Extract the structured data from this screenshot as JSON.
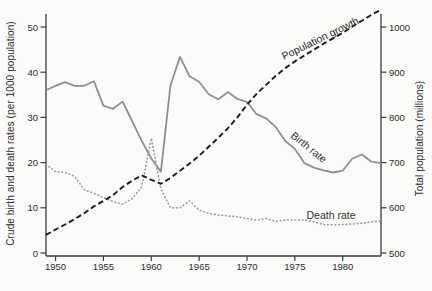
{
  "figure": {
    "background": "#fbfbf9",
    "axis_color": "#3a3a3a",
    "tick_label_color": "#2b2b2b",
    "left_axis_title": "Crude birth and death rates (per 1000 population)",
    "right_axis_title": "Total population (millions)",
    "curve_labels": {
      "population": "Population growth",
      "birth": "Birth rate",
      "death": "Death rate"
    }
  },
  "chart_data": {
    "type": "line",
    "title": "",
    "xlabel": "",
    "ylabel_left": "Crude birth and death rates (per 1000 population)",
    "ylabel_right": "Total population (millions)",
    "grid": false,
    "legend_position": "labels-on-curves",
    "x_axis": {
      "range": [
        1949,
        1984
      ],
      "ticks": [
        1950,
        1955,
        1960,
        1965,
        1970,
        1975,
        1980
      ]
    },
    "left_axis": {
      "range": [
        0,
        53
      ],
      "ticks": [
        0,
        10,
        20,
        30,
        40,
        50
      ]
    },
    "right_axis": {
      "range": [
        500,
        1040
      ],
      "ticks": [
        500,
        600,
        700,
        800,
        900,
        1000
      ]
    },
    "x": [
      1949,
      1950,
      1951,
      1952,
      1953,
      1954,
      1955,
      1956,
      1957,
      1958,
      1959,
      1960,
      1961,
      1962,
      1963,
      1964,
      1965,
      1966,
      1967,
      1968,
      1969,
      1970,
      1971,
      1972,
      1973,
      1974,
      1975,
      1976,
      1977,
      1978,
      1979,
      1980,
      1981,
      1982,
      1983,
      1984
    ],
    "series": [
      {
        "name": "Birth rate",
        "axis": "left",
        "style": "solid",
        "color": "#8f8f8f",
        "values": [
          36.0,
          37.0,
          37.8,
          37.0,
          37.0,
          38.0,
          32.6,
          31.9,
          33.5,
          29.2,
          24.8,
          20.9,
          18.0,
          37.0,
          43.4,
          39.1,
          37.9,
          35.1,
          34.0,
          35.6,
          34.1,
          33.4,
          30.7,
          29.8,
          27.9,
          24.8,
          23.0,
          19.9,
          18.9,
          18.3,
          17.8,
          18.2,
          20.9,
          21.8,
          20.2,
          19.9
        ]
      },
      {
        "name": "Death rate",
        "axis": "left",
        "style": "dotted",
        "color": "#9d9d9d",
        "values": [
          19.6,
          18.0,
          17.8,
          17.0,
          14.0,
          13.2,
          12.3,
          11.4,
          10.8,
          12.0,
          14.6,
          25.4,
          14.2,
          10.0,
          10.0,
          11.5,
          9.5,
          8.8,
          8.4,
          8.2,
          8.0,
          7.6,
          7.3,
          7.6,
          7.0,
          7.3,
          7.3,
          7.3,
          6.9,
          6.3,
          6.2,
          6.3,
          6.4,
          6.6,
          6.9,
          7.1
        ]
      },
      {
        "name": "Population growth",
        "axis": "right",
        "style": "dashed",
        "color": "#1b1b1b",
        "values": [
          540,
          552,
          563,
          575,
          588,
          603,
          615,
          628,
          646,
          660,
          672,
          662,
          653,
          666,
          682,
          698,
          715,
          735,
          755,
          776,
          800,
          828,
          852,
          872,
          892,
          909,
          924,
          937,
          950,
          963,
          975,
          987,
          1001,
          1014,
          1027,
          1038
        ]
      }
    ]
  }
}
